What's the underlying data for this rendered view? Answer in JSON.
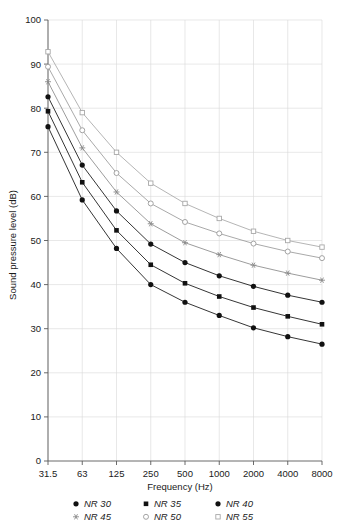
{
  "chart_data": {
    "type": "line",
    "title": "",
    "xlabel": "Frequency (Hz)",
    "ylabel": "Sound pressure level (dB)",
    "categories": [
      "31.5",
      "63",
      "125",
      "250",
      "500",
      "1000",
      "2000",
      "4000",
      "8000"
    ],
    "x_tick_labels": [
      "31.5",
      "63",
      "125",
      "250",
      "500",
      "1000",
      "2000",
      "4000",
      "8000"
    ],
    "y_tick_labels": [
      "0",
      "10",
      "20",
      "30",
      "40",
      "50",
      "60",
      "70",
      "80",
      "90",
      "100"
    ],
    "ylim": [
      0,
      100
    ],
    "y_major_step": 10,
    "grid": true,
    "legend_position": "bottom",
    "series": [
      {
        "name": "NR 30",
        "label": "NR 30",
        "marker": "filled-circle",
        "color": "#111111",
        "values": [
          75.8,
          59.2,
          48.2,
          40.0,
          36.0,
          33.0,
          30.2,
          28.2,
          26.5
        ]
      },
      {
        "name": "NR 35",
        "label": "NR 35",
        "marker": "filled-square",
        "color": "#111111",
        "values": [
          79.3,
          63.2,
          52.3,
          44.5,
          40.3,
          37.3,
          34.8,
          32.8,
          31.0
        ]
      },
      {
        "name": "NR 40",
        "label": "NR 40",
        "marker": "filled-circle",
        "color": "#111111",
        "values": [
          82.6,
          67.1,
          56.7,
          49.2,
          45.0,
          42.0,
          39.6,
          37.6,
          36.0
        ]
      },
      {
        "name": "NR 45",
        "label": "NR 45",
        "marker": "star",
        "color": "#8a8a8a",
        "values": [
          86.0,
          71.0,
          61.0,
          53.8,
          49.5,
          46.8,
          44.4,
          42.6,
          41.0
        ]
      },
      {
        "name": "NR 50",
        "label": "NR 50",
        "marker": "open-circle",
        "color": "#9a9a9a",
        "values": [
          89.4,
          75.0,
          65.3,
          58.4,
          54.2,
          51.6,
          49.3,
          47.5,
          46.0
        ]
      },
      {
        "name": "NR 55",
        "label": "NR 55",
        "marker": "open-square",
        "color": "#a8a8a8",
        "values": [
          92.8,
          79.0,
          70.0,
          63.0,
          58.4,
          55.0,
          52.1,
          50.0,
          48.5
        ]
      }
    ]
  },
  "legend": {
    "items": [
      {
        "label": "NR 30",
        "marker": "filled-circle"
      },
      {
        "label": "NR 35",
        "marker": "filled-square"
      },
      {
        "label": "NR 40",
        "marker": "filled-circle"
      },
      {
        "label": "NR 45",
        "marker": "star"
      },
      {
        "label": "NR 50",
        "marker": "open-circle"
      },
      {
        "label": "NR 55",
        "marker": "open-square"
      }
    ]
  },
  "colors": {
    "grid": "#d8d8d8",
    "axis": "#5a5a5a",
    "dark_series": "#111111",
    "light_series": "#9a9a9a",
    "background": "#ffffff"
  }
}
